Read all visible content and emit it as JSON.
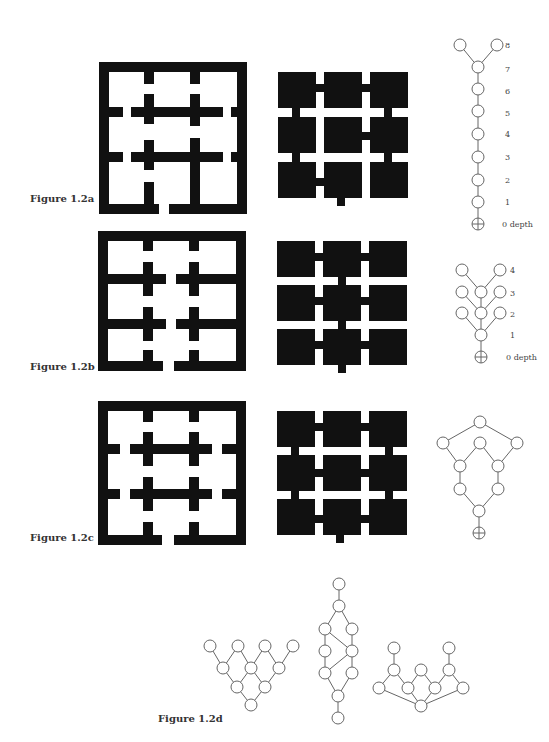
{
  "figures": [
    {
      "id": "1.2a",
      "label": "Figure 1.2a",
      "depth_labels": [
        "8",
        "7",
        "6",
        "5",
        "4",
        "3",
        "2",
        "1",
        "0 depth"
      ]
    },
    {
      "id": "1.2b",
      "label": "Figure 1.2b",
      "depth_labels": [
        "4",
        "3",
        "2",
        "1",
        "0 depth"
      ]
    },
    {
      "id": "1.2c",
      "label": "Figure 1.2c"
    },
    {
      "id": "1.2d",
      "label": "Figure 1.2d"
    }
  ],
  "colors": {
    "wall": "#111111",
    "graph_line": "#666666",
    "node_fill": "#ffffff"
  }
}
